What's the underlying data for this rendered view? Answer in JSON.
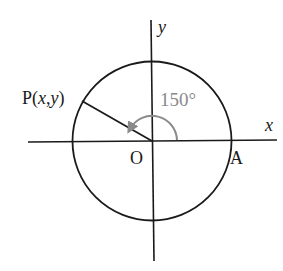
{
  "diagram": {
    "type": "unit-circle-angle",
    "labels": {
      "x_axis": "x",
      "y_axis": "y",
      "origin": "O",
      "point_a": "A",
      "point_p_prefix": "P(",
      "point_p_x": "x",
      "point_p_comma": ",",
      "point_p_y": "y",
      "point_p_suffix": ")",
      "angle": "150°"
    },
    "angle_degrees": 150,
    "colors": {
      "lines": "#1a1a1a",
      "angle_arc": "#8a8a8a",
      "background": "#ffffff"
    }
  }
}
